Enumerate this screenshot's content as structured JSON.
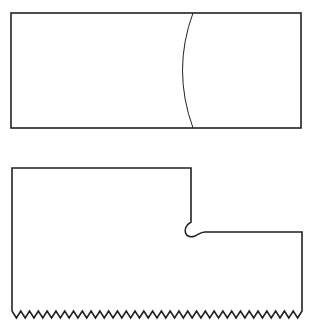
{
  "diagram": {
    "canvas": {
      "width": 317,
      "height": 330,
      "background": "#ffffff"
    },
    "stroke_color": "#222222",
    "top_shape": {
      "type": "rectangle-with-arc",
      "rect": {
        "x": 11,
        "y": 13,
        "width": 290,
        "height": 115
      },
      "arc": {
        "start": [
          193,
          13
        ],
        "control": [
          172,
          70
        ],
        "end": [
          193,
          128
        ]
      }
    },
    "bottom_shape": {
      "type": "stepped-piece-with-serrated-bottom",
      "left_x": 12,
      "top_y": 168,
      "step_x": 191,
      "step_y": 234,
      "right_x": 302,
      "notch_radius": 7,
      "serration": {
        "y_top": 311,
        "y_bottom": 318,
        "teeth": 33
      }
    }
  }
}
